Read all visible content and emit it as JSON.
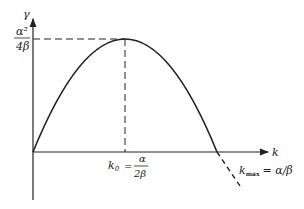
{
  "diagram": {
    "y_axis_label": "γ",
    "x_axis_label": "k",
    "peak_label_num": "α²",
    "peak_label_den": "4β",
    "k0_label": "k",
    "k0_sub": "0",
    "k0_eq": "=",
    "k0_num": "α",
    "k0_den": "2β",
    "kmax_label": "k",
    "kmax_sub": "max",
    "kmax_eq": "= α/β",
    "colors": {
      "line": "#222222",
      "background": "#ffffff"
    }
  }
}
